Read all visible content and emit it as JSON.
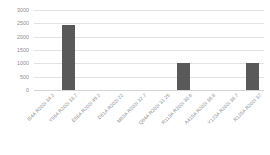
{
  "chart_data": {
    "type": "bar",
    "title": "",
    "subtitle": "",
    "xlabel": "",
    "ylabel": "",
    "ylim": [
      0,
      3000
    ],
    "ytick_step": 500,
    "yticks": [
      0,
      500,
      1000,
      1500,
      2000,
      2500,
      3000
    ],
    "ytick_labels": [
      "0",
      "500",
      "1000",
      "1500",
      "2000",
      "2500",
      "3000"
    ],
    "grid": true,
    "legend": false,
    "legend_position": "none",
    "bar_color": "#595959",
    "gridline_color": "#e2e2e2",
    "tick_label_color": "#8a8a8a",
    "categories": [
      "I54A R202i 34.2",
      "Y56A R202i 33.7",
      "E58A R202i 49.2",
      "D61A R202i 22",
      "M63A R202i 32.7",
      "Q64A R202i 31.25",
      "R113A R202i 30.6",
      "A415A R202i 36.6",
      "Y123A R202i 36.7",
      "R125A R202i 37"
    ],
    "values": [
      0,
      2420,
      0,
      0,
      0,
      0,
      1000,
      0,
      0,
      1000
    ],
    "series": [
      {
        "name": "",
        "values": [
          0,
          2420,
          0,
          0,
          0,
          0,
          1000,
          0,
          0,
          1000
        ]
      }
    ]
  }
}
